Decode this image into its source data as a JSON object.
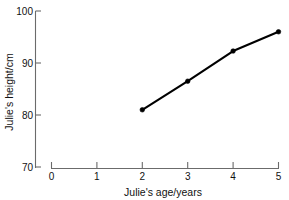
{
  "chart_data": {
    "type": "line",
    "title": "",
    "xlabel": "Julie's age/years",
    "ylabel": "Julie's height/cm",
    "x": [
      2,
      3,
      4,
      5
    ],
    "values": [
      81,
      86.5,
      92.3,
      96
    ],
    "series": [
      {
        "name": "Julie's height",
        "x": [
          2,
          3,
          4,
          5
        ],
        "values": [
          81,
          86.5,
          92.3,
          96
        ]
      }
    ],
    "xlim": [
      0,
      5
    ],
    "ylim": [
      70,
      100
    ],
    "xticks": [
      0,
      1,
      2,
      3,
      4,
      5
    ],
    "yticks": [
      70,
      80,
      90,
      100
    ],
    "xtick_labels": [
      "0",
      "1",
      "2",
      "3",
      "4",
      "5"
    ],
    "ytick_labels": [
      "70",
      "80",
      "90",
      "100"
    ],
    "grid": false,
    "legend": false,
    "marker": "filled-circle",
    "line_color": "#000000",
    "axis_color": "#6b6b6b",
    "background_color": "#ffffff"
  },
  "axes": {
    "x_title": "Julie's age/years",
    "y_title": "Julie's height/cm"
  },
  "labels": {
    "y": [
      "100",
      "90",
      "80",
      "70"
    ],
    "x": [
      "0",
      "1",
      "2",
      "3",
      "4",
      "5"
    ]
  }
}
